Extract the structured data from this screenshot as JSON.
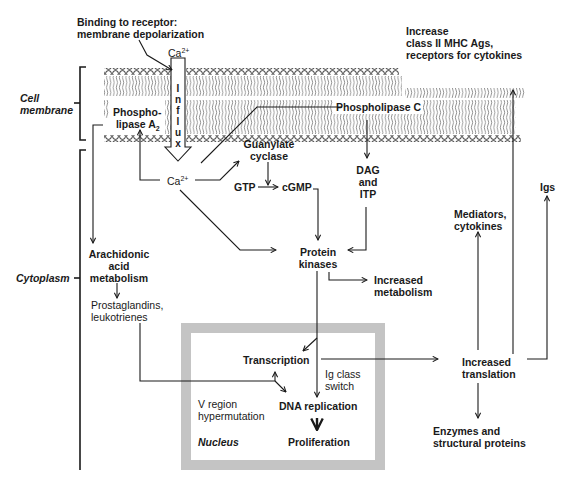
{
  "diagram": {
    "regions": {
      "cell_membrane": "Cell membrane",
      "cytoplasm": "Cytoplasm",
      "nucleus": "Nucleus"
    },
    "nodes": {
      "binding": [
        "Binding to receptor:",
        "membrane depolarization"
      ],
      "ca_top": "Ca",
      "ca_top_sup": "2+",
      "influx": [
        "I",
        "n",
        "f",
        "l",
        "u",
        "x"
      ],
      "pla2": [
        "Phospho-",
        "lipase A"
      ],
      "pla2_sub": "2",
      "plc": "Phospholipase C",
      "ca_mid": "Ca",
      "ca_mid_sup": "2+",
      "guanylate": [
        "Guanylate",
        "cyclase"
      ],
      "gtp": "GTP",
      "cgmp": "cGMP",
      "dag": [
        "DAG",
        "and",
        "ITP"
      ],
      "increase_mhc": [
        "Increase",
        "class II MHC Ags,",
        "receptors for cytokines"
      ],
      "igs": "Igs",
      "mediators": [
        "Mediators,",
        "cytokines"
      ],
      "arachidonic": [
        "Arachidonic",
        "acid",
        "metabolism"
      ],
      "prostaglandins": [
        "Prostaglandins,",
        "leukotrienes"
      ],
      "protein_kinases": [
        "Protein",
        "kinases"
      ],
      "increased_metabolism": [
        "Increased",
        "metabolism"
      ],
      "transcription": "Transcription",
      "ig_class_switch": [
        "Ig class",
        "switch"
      ],
      "v_region": [
        "V region",
        "hypermutation"
      ],
      "dna_replication": "DNA replication",
      "proliferation": "Proliferation",
      "increased_translation": [
        "Increased",
        "translation"
      ],
      "enzymes": [
        "Enzymes and",
        "structural proteins"
      ]
    },
    "colors": {
      "line": "#1a1a1a",
      "nucleus_border": "#c4c4c4",
      "background": "#ffffff"
    }
  }
}
